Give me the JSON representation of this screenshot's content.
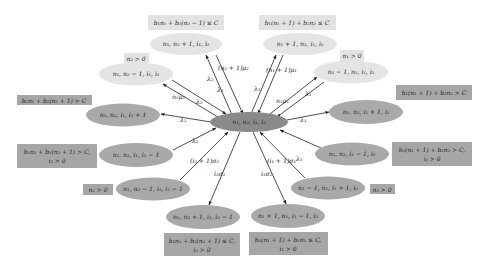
{
  "diagram": {
    "type": "state-transition",
    "colors": {
      "center_fill": "#8a8a8a",
      "light_fill": "#e4e4e4",
      "dark_fill": "#a9a9a9",
      "light_cond_fill": "#e2e2e2",
      "dark_cond_fill": "#a6a6a6",
      "arrow": "#222222"
    },
    "center": {
      "label": "n₁, n₂, i₁, i₂"
    },
    "states": [
      {
        "id": "s_n2p",
        "label": "n₁, n₂ + 1, i₁, i₂",
        "tone": "light",
        "condition": [
          "b₁n₁ + b₂(n₂ − 1) ≤ C"
        ]
      },
      {
        "id": "s_n1p",
        "label": "n₁ + 1, n₂, i₁, i₂",
        "tone": "light",
        "condition": [
          "b₁(n₁ + 1) + b₂n₂ ≤ C"
        ]
      },
      {
        "id": "s_n2m",
        "label": "n₁, n₂ − 1, i₁, i₂",
        "tone": "light",
        "condition": [
          "n₂ > 0"
        ]
      },
      {
        "id": "s_n1m",
        "label": "n₁ − 1, n₂, i₁, i₂",
        "tone": "light",
        "condition": [
          "n₁ > 0"
        ]
      },
      {
        "id": "s_i2p",
        "label": "n₁, n₂, i₁, i₂ + 1",
        "tone": "dark",
        "condition": [
          "b₁n₁ + b₂(n₂ + 1) > C"
        ]
      },
      {
        "id": "s_i1p",
        "label": "n₁, n₂, i₁ + 1, i₂",
        "tone": "dark",
        "condition": [
          "b₁(n₁ + 1) + b₂n₂ > C"
        ]
      },
      {
        "id": "s_i2m",
        "label": "n₁, n₂, i₁, i₂ − 1",
        "tone": "dark",
        "condition": [
          "b₁n₁ + b₂(n₂ + 1) > C,",
          "i₂ > 0"
        ]
      },
      {
        "id": "s_i1m",
        "label": "n₁, n₂, i₁ − 1, i₂",
        "tone": "dark",
        "condition": [
          "b₁(n₁ + 1) + b₂n₂ > C,",
          "i₁ > 0"
        ]
      },
      {
        "id": "s_n2m_i2m",
        "label": "n₁, n₂ − 1, i₁, i₂ − 1",
        "tone": "dark",
        "condition": [
          "n₂ > 0"
        ]
      },
      {
        "id": "s_n1m_i1p",
        "label": "n₁ − 1, n₂, i₁ + 1, i₂",
        "tone": "dark",
        "condition": [
          "n₁ > 0"
        ]
      },
      {
        "id": "s_n2p_i2m",
        "label": "n₁, n₂ + 1, i₁, i₂ − 1",
        "tone": "dark",
        "condition": [
          "b₁n₁ + b₂(n₂ + 1) ≤ C,",
          "i₂ > 0"
        ]
      },
      {
        "id": "s_n1p_i1m",
        "label": "n₁ + 1, n₂, i₁ − 1, i₂",
        "tone": "dark",
        "condition": [
          "b₁(n₁ + 1) + b₂n₂ ≤ C,",
          "i₁ > 0"
        ]
      }
    ],
    "edge_labels": {
      "to_n2p": "λ₂",
      "from_n2p": "(n₂ + 1)μ₂",
      "from_n2p_l2": "λ₂",
      "to_n1p": "λ₁",
      "from_n1p": "(n₁ + 1)μ₁",
      "to_n2m": "n₂μ₂",
      "from_n2m": "λ₂",
      "to_n1m": "n₁μ₁",
      "from_n1m": "λ₁",
      "to_i2p": "λ₂",
      "to_i1p": "λ₁",
      "from_i2m": "λ₂",
      "from_i1m": "λ₁",
      "from_n2m_i2m": "(i₂ + 1)σ₂",
      "from_n1m_i1p": "(i₁ + 1)σ₁",
      "to_n2p_i2m": "i₂σ₂",
      "to_n1p_i1m": "i₁σ₁"
    }
  }
}
